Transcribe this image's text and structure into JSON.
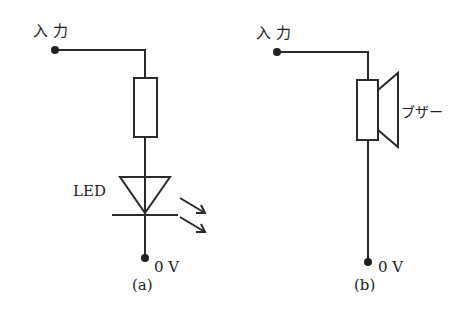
{
  "circuit_a": {
    "input_label": "入 力",
    "led_label": "LED",
    "ground_label": "0 V",
    "caption": "(a)"
  },
  "circuit_b": {
    "input_label": "入 力",
    "buzzer_label": "ブザー",
    "ground_label": "0 V",
    "caption": "(b)"
  },
  "colors": {
    "line": "#2a2a2a"
  }
}
